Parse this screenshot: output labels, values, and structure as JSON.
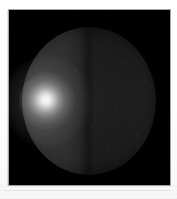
{
  "figure": {
    "kind": "astronomical-image",
    "caption": "",
    "media": "monochrome photographic plate"
  },
  "plate": {
    "background_color": "#000000",
    "border_color": "#bdbdbd",
    "paper_color": "#ffffff",
    "x": 9,
    "y": 10,
    "width": 161,
    "height": 175
  },
  "chart_data": {
    "type": "heatmap",
    "title": "",
    "subtitle": "",
    "xlabel": "",
    "ylabel": "",
    "colormap": "grayscale",
    "grid": false,
    "legend": "none",
    "annotations": [],
    "tick_labels": {
      "x": [],
      "y": []
    },
    "xlim": [
      0,
      161
    ],
    "ylim": [
      0,
      175
    ],
    "features": [
      {
        "name": "disk",
        "shape": "circle",
        "center_x": 80,
        "center_y": 91,
        "radius_x": 67,
        "radius_y": 74,
        "mean_intensity": 0.09,
        "description": "faint circular disk filling most of the frame"
      },
      {
        "name": "bright-hotspot",
        "shape": "gaussian-blob",
        "center_x": 38,
        "center_y": 91,
        "radius_x": 28,
        "radius_y": 29,
        "peak_intensity": 0.96,
        "description": "diffuse saturated bright spot on the left limb region"
      },
      {
        "name": "bright-hemisphere",
        "shape": "half-disk",
        "side": "left",
        "mean_intensity": 0.14,
        "description": "left half of disk brighter than right half"
      },
      {
        "name": "dark-hemisphere",
        "shape": "half-disk",
        "side": "right",
        "mean_intensity": 0.03,
        "description": "right half of disk near background level"
      },
      {
        "name": "terminator",
        "shape": "vertical-band",
        "center_x": 78,
        "mean_intensity": 0.02,
        "description": "vertical low-intensity boundary separating the two hemispheres"
      },
      {
        "name": "sky-background",
        "shape": "field",
        "mean_intensity": 0.0,
        "description": "black sky surrounding the disk"
      }
    ],
    "intensity_scale": {
      "min": 0.0,
      "max": 1.0,
      "units": "normalized"
    }
  },
  "artifacts": {
    "scan_lines_label": "faint horizontal scanner lines below plate",
    "margin_rule_label": "thin vertical printed rule at left margin"
  }
}
